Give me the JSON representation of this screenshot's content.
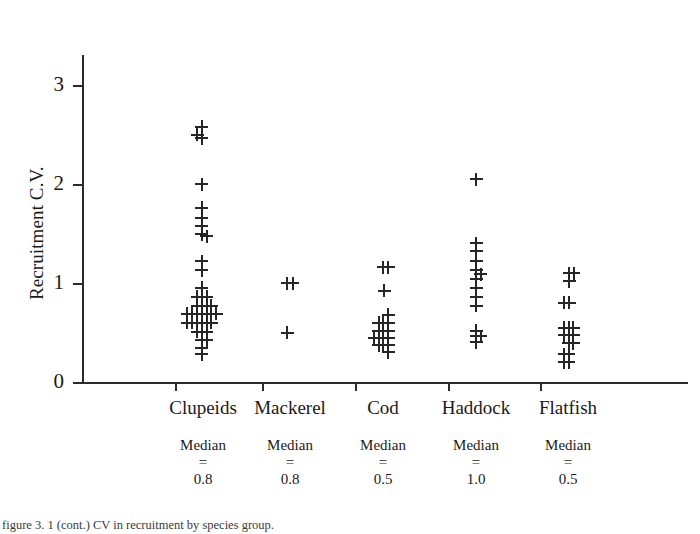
{
  "chart_data": {
    "type": "scatter",
    "title": "",
    "subtitle": "",
    "xlabel": "",
    "ylabel": "Recruitment C.V.",
    "grid": false,
    "legend": "none",
    "marker": "plus",
    "ylim": [
      0,
      3.5
    ],
    "yticks": [
      "0",
      "1",
      "2",
      "3"
    ],
    "ytick_values": [
      0,
      1,
      2,
      3
    ],
    "categories": [
      "Clupeids",
      "Mackerel",
      "Cod",
      "Haddock",
      "Flatfish"
    ],
    "annotations": {
      "median_label": "Median",
      "equals_sign": "=",
      "medians": [
        "0.8",
        "0.8",
        "0.5",
        "1.0",
        "0.5"
      ]
    },
    "series": [
      {
        "name": "Clupeids",
        "count": 44,
        "points": [
          {
            "offset": -0.45,
            "value": 2.5
          },
          {
            "offset": -0.1,
            "value": 2.58
          },
          {
            "offset": -0.1,
            "value": 2.46
          },
          {
            "offset": -0.1,
            "value": 2.0
          },
          {
            "offset": -0.1,
            "value": 1.76
          },
          {
            "offset": -0.1,
            "value": 1.66
          },
          {
            "offset": -0.1,
            "value": 1.58
          },
          {
            "offset": -0.1,
            "value": 1.49
          },
          {
            "offset": 0.28,
            "value": 1.47
          },
          {
            "offset": -0.1,
            "value": 1.22
          },
          {
            "offset": -0.1,
            "value": 1.13
          },
          {
            "offset": -0.1,
            "value": 0.95
          },
          {
            "offset": -0.45,
            "value": 0.86
          },
          {
            "offset": -0.1,
            "value": 0.86
          },
          {
            "offset": 0.28,
            "value": 0.86
          },
          {
            "offset": -0.45,
            "value": 0.77
          },
          {
            "offset": -0.1,
            "value": 0.77
          },
          {
            "offset": 0.28,
            "value": 0.77
          },
          {
            "offset": 0.64,
            "value": 0.77
          },
          {
            "offset": -1.2,
            "value": 0.69
          },
          {
            "offset": -0.82,
            "value": 0.69
          },
          {
            "offset": -0.45,
            "value": 0.69
          },
          {
            "offset": -0.1,
            "value": 0.69
          },
          {
            "offset": 0.28,
            "value": 0.69
          },
          {
            "offset": 0.64,
            "value": 0.69
          },
          {
            "offset": 1.02,
            "value": 0.69
          },
          {
            "offset": -1.2,
            "value": 0.6
          },
          {
            "offset": -0.82,
            "value": 0.6
          },
          {
            "offset": -0.45,
            "value": 0.6
          },
          {
            "offset": -0.1,
            "value": 0.6
          },
          {
            "offset": 0.28,
            "value": 0.6
          },
          {
            "offset": 0.64,
            "value": 0.6
          },
          {
            "offset": -0.45,
            "value": 0.51
          },
          {
            "offset": -0.1,
            "value": 0.51
          },
          {
            "offset": 0.28,
            "value": 0.51
          },
          {
            "offset": -0.1,
            "value": 0.42
          },
          {
            "offset": 0.28,
            "value": 0.42
          },
          {
            "offset": -0.1,
            "value": 0.34
          },
          {
            "offset": -0.1,
            "value": 0.28
          }
        ]
      },
      {
        "name": "Mackerel",
        "count": 3,
        "points": [
          {
            "offset": -0.2,
            "value": 1.0
          },
          {
            "offset": 0.22,
            "value": 1.0
          },
          {
            "offset": -0.2,
            "value": 0.5
          }
        ]
      },
      {
        "name": "Cod",
        "count": 20,
        "points": [
          {
            "offset": 0.0,
            "value": 1.16
          },
          {
            "offset": 0.4,
            "value": 1.16
          },
          {
            "offset": 0.1,
            "value": 0.92
          },
          {
            "offset": 0.4,
            "value": 0.68
          },
          {
            "offset": -0.32,
            "value": 0.6
          },
          {
            "offset": 0.03,
            "value": 0.6
          },
          {
            "offset": 0.4,
            "value": 0.6
          },
          {
            "offset": -0.32,
            "value": 0.52
          },
          {
            "offset": 0.03,
            "value": 0.52
          },
          {
            "offset": 0.4,
            "value": 0.52
          },
          {
            "offset": -0.68,
            "value": 0.44
          },
          {
            "offset": -0.32,
            "value": 0.44
          },
          {
            "offset": 0.03,
            "value": 0.44
          },
          {
            "offset": 0.4,
            "value": 0.44
          },
          {
            "offset": -0.32,
            "value": 0.37
          },
          {
            "offset": 0.03,
            "value": 0.37
          },
          {
            "offset": 0.4,
            "value": 0.37
          },
          {
            "offset": 0.4,
            "value": 0.3
          }
        ]
      },
      {
        "name": "Haddock",
        "count": 14,
        "points": [
          {
            "offset": 0.0,
            "value": 2.05
          },
          {
            "offset": 0.0,
            "value": 1.4
          },
          {
            "offset": 0.0,
            "value": 1.32
          },
          {
            "offset": 0.0,
            "value": 1.22
          },
          {
            "offset": 0.0,
            "value": 1.13
          },
          {
            "offset": 0.36,
            "value": 1.09
          },
          {
            "offset": 0.0,
            "value": 1.04
          },
          {
            "offset": 0.0,
            "value": 0.95
          },
          {
            "offset": 0.0,
            "value": 0.86
          },
          {
            "offset": 0.0,
            "value": 0.77
          },
          {
            "offset": 0.0,
            "value": 0.52
          },
          {
            "offset": 0.0,
            "value": 0.46
          },
          {
            "offset": 0.36,
            "value": 0.46
          },
          {
            "offset": 0.0,
            "value": 0.4
          }
        ]
      },
      {
        "name": "Flatfish",
        "count": 18,
        "points": [
          {
            "offset": 0.1,
            "value": 1.1
          },
          {
            "offset": 0.46,
            "value": 1.1
          },
          {
            "offset": 0.1,
            "value": 1.02
          },
          {
            "offset": -0.28,
            "value": 0.8
          },
          {
            "offset": 0.08,
            "value": 0.8
          },
          {
            "offset": -0.3,
            "value": 0.55
          },
          {
            "offset": 0.06,
            "value": 0.55
          },
          {
            "offset": 0.42,
            "value": 0.55
          },
          {
            "offset": -0.3,
            "value": 0.47
          },
          {
            "offset": 0.06,
            "value": 0.47
          },
          {
            "offset": 0.42,
            "value": 0.47
          },
          {
            "offset": 0.06,
            "value": 0.39
          },
          {
            "offset": 0.42,
            "value": 0.39
          },
          {
            "offset": -0.3,
            "value": 0.28
          },
          {
            "offset": 0.06,
            "value": 0.28
          },
          {
            "offset": -0.3,
            "value": 0.2
          },
          {
            "offset": 0.06,
            "value": 0.2
          }
        ]
      }
    ]
  },
  "caption": {
    "text": "figure 3. 1 (cont.) CV in recruitment by species group."
  }
}
